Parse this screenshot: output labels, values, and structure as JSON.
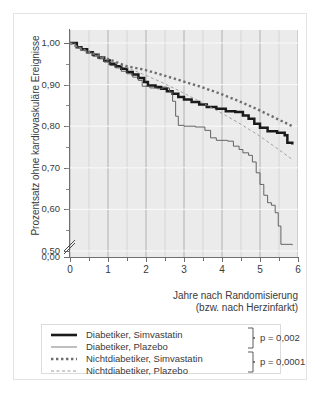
{
  "chart_data": {
    "type": "line",
    "title": "",
    "xlabel": "Jahre nach Randomisierung (bzw. nach Herzinfarkt)",
    "xlabel_line1": "Jahre nach Randomisierung",
    "xlabel_line2": "(bzw. nach Herzinfarkt)",
    "ylabel": "Prozentsatz ohne kardiovaskuläre Ereignisse",
    "xlim": [
      0,
      6
    ],
    "ylim": [
      0.5,
      1.0
    ],
    "y_axis_break": true,
    "grid": true,
    "grid_x_step": 0.5,
    "legend_position": "below",
    "xticks": [
      "0",
      "1",
      "2",
      "3",
      "4",
      "5",
      "6"
    ],
    "xtick_values": [
      0,
      1,
      2,
      3,
      4,
      5,
      6
    ],
    "yticks": [
      "0,00",
      "0,50",
      "0,60",
      "0,70",
      "0,80",
      "0,90",
      "1,00"
    ],
    "ytick_values": [
      0.0,
      0.5,
      0.6,
      0.7,
      0.8,
      0.9,
      1.0
    ],
    "series": [
      {
        "name": "Diabetiker, Simvastatin",
        "style": "solid-thick",
        "color": "#1a1a1a",
        "points": [
          [
            0.0,
            1.0
          ],
          [
            0.18,
            0.99
          ],
          [
            0.3,
            0.985
          ],
          [
            0.45,
            0.978
          ],
          [
            0.6,
            0.972
          ],
          [
            0.75,
            0.965
          ],
          [
            0.9,
            0.958
          ],
          [
            1.05,
            0.95
          ],
          [
            1.2,
            0.944
          ],
          [
            1.35,
            0.938
          ],
          [
            1.5,
            0.93
          ],
          [
            1.65,
            0.924
          ],
          [
            1.8,
            0.916
          ],
          [
            1.95,
            0.906
          ],
          [
            2.05,
            0.898
          ],
          [
            2.25,
            0.894
          ],
          [
            2.4,
            0.89
          ],
          [
            2.55,
            0.884
          ],
          [
            2.7,
            0.878
          ],
          [
            2.85,
            0.87
          ],
          [
            3.0,
            0.864
          ],
          [
            3.2,
            0.858
          ],
          [
            3.4,
            0.852
          ],
          [
            3.6,
            0.846
          ],
          [
            3.85,
            0.842
          ],
          [
            4.1,
            0.836
          ],
          [
            4.35,
            0.834
          ],
          [
            4.55,
            0.826
          ],
          [
            4.7,
            0.818
          ],
          [
            4.85,
            0.806
          ],
          [
            5.0,
            0.796
          ],
          [
            5.2,
            0.788
          ],
          [
            5.45,
            0.784
          ],
          [
            5.65,
            0.778
          ],
          [
            5.72,
            0.76
          ],
          [
            5.85,
            0.756
          ]
        ]
      },
      {
        "name": "Diabetiker, Plazebo",
        "style": "solid-thin",
        "color": "#555555",
        "points": [
          [
            0.0,
            1.0
          ],
          [
            0.15,
            0.99
          ],
          [
            0.3,
            0.982
          ],
          [
            0.45,
            0.976
          ],
          [
            0.6,
            0.968
          ],
          [
            0.75,
            0.962
          ],
          [
            0.9,
            0.954
          ],
          [
            1.05,
            0.946
          ],
          [
            1.2,
            0.94
          ],
          [
            1.35,
            0.932
          ],
          [
            1.5,
            0.926
          ],
          [
            1.65,
            0.918
          ],
          [
            1.8,
            0.91
          ],
          [
            1.9,
            0.896
          ],
          [
            2.1,
            0.892
          ],
          [
            2.3,
            0.89
          ],
          [
            2.45,
            0.894
          ],
          [
            2.55,
            0.892
          ],
          [
            2.62,
            0.882
          ],
          [
            2.7,
            0.86
          ],
          [
            2.78,
            0.824
          ],
          [
            2.85,
            0.802
          ],
          [
            3.0,
            0.8
          ],
          [
            3.3,
            0.798
          ],
          [
            3.55,
            0.79
          ],
          [
            3.7,
            0.772
          ],
          [
            3.85,
            0.766
          ],
          [
            4.15,
            0.764
          ],
          [
            4.3,
            0.752
          ],
          [
            4.45,
            0.744
          ],
          [
            4.55,
            0.736
          ],
          [
            4.7,
            0.73
          ],
          [
            4.8,
            0.714
          ],
          [
            4.9,
            0.688
          ],
          [
            5.0,
            0.66
          ],
          [
            5.1,
            0.634
          ],
          [
            5.2,
            0.616
          ],
          [
            5.3,
            0.61
          ],
          [
            5.4,
            0.592
          ],
          [
            5.48,
            0.56
          ],
          [
            5.55,
            0.516
          ],
          [
            5.85,
            0.514
          ]
        ]
      },
      {
        "name": "Nichtdiabetiker, Simvastatin",
        "style": "dotted-thick",
        "color": "#6e6e6e",
        "points": [
          [
            0.0,
            1.0
          ],
          [
            0.3,
            0.986
          ],
          [
            0.7,
            0.972
          ],
          [
            1.1,
            0.958
          ],
          [
            1.5,
            0.944
          ],
          [
            1.95,
            0.936
          ],
          [
            2.4,
            0.924
          ],
          [
            2.9,
            0.91
          ],
          [
            3.4,
            0.896
          ],
          [
            3.9,
            0.88
          ],
          [
            4.4,
            0.862
          ],
          [
            4.9,
            0.842
          ],
          [
            5.4,
            0.82
          ],
          [
            5.85,
            0.8
          ]
        ]
      },
      {
        "name": "Nichtdiabetiker, Plazebo",
        "style": "dashed-thin",
        "color": "#9a9a9a",
        "points": [
          [
            0.0,
            1.0
          ],
          [
            0.4,
            0.98
          ],
          [
            0.9,
            0.962
          ],
          [
            1.4,
            0.944
          ],
          [
            1.9,
            0.926
          ],
          [
            2.4,
            0.906
          ],
          [
            2.9,
            0.884
          ],
          [
            3.4,
            0.86
          ],
          [
            3.9,
            0.836
          ],
          [
            4.4,
            0.81
          ],
          [
            4.9,
            0.782
          ],
          [
            5.4,
            0.75
          ],
          [
            5.85,
            0.72
          ]
        ]
      }
    ]
  },
  "legend": {
    "rows": [
      {
        "label": "Diabetiker, Simvastatin",
        "style": "solid-thick"
      },
      {
        "label": "Diabetiker, Plazebo",
        "style": "solid-thin"
      },
      {
        "label": "Nichtdiabetiker, Simvastatin",
        "style": "dotted-thick"
      },
      {
        "label": "Nichtdiabetiker, Plazebo",
        "style": "dashed-thin"
      }
    ],
    "p_values": [
      "p = 0,002",
      "p = 0,0001"
    ]
  },
  "colors": {
    "plot_background": "#ebebeb",
    "grid": "#ffffff",
    "grid_major": "#b8b8b8",
    "axis": "#6f6f6f",
    "text": "#3a3a3a",
    "frame": "#e3e3e3"
  }
}
